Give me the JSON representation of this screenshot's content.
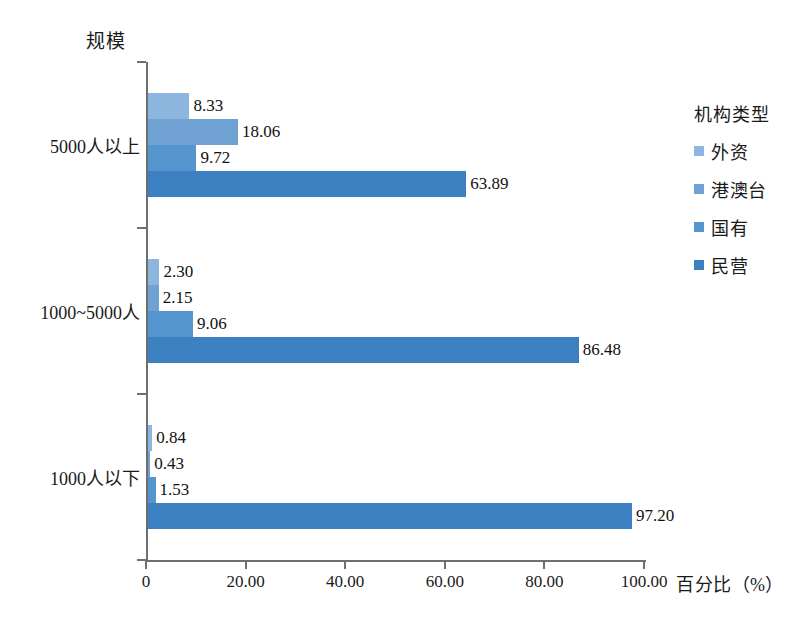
{
  "chart_data": {
    "type": "bar",
    "orientation": "horizontal",
    "grouped": true,
    "title": "",
    "xlabel": "百分比（%）",
    "ylabel": "规模",
    "categories": [
      "5000人以上",
      "1000~5000人",
      "1000人以下"
    ],
    "xlim": [
      0,
      100
    ],
    "xticks": [
      0,
      20,
      40,
      60,
      80,
      100
    ],
    "xticklabels": [
      "0",
      "20.00",
      "40.00",
      "60.00",
      "80.00",
      "100.00"
    ],
    "grid": false,
    "legend_title": "机构类型",
    "legend_position": "right",
    "series": [
      {
        "name": "外资",
        "color": "#8cb6dd",
        "values": [
          8.33,
          2.3,
          0.84
        ],
        "labels": [
          "8.33",
          "2.30",
          "0.84"
        ]
      },
      {
        "name": "港澳台",
        "color": "#6fa2d3",
        "values": [
          18.06,
          2.15,
          0.43
        ],
        "labels": [
          "18.06",
          "2.15",
          "0.43"
        ]
      },
      {
        "name": "国有",
        "color": "#5495cd",
        "values": [
          9.72,
          9.06,
          1.53
        ],
        "labels": [
          "9.72",
          "9.06",
          "1.53"
        ]
      },
      {
        "name": "民营",
        "color": "#3d80c2",
        "values": [
          63.89,
          86.48,
          97.2
        ],
        "labels": [
          "63.89",
          "86.48",
          "97.20"
        ]
      }
    ]
  }
}
